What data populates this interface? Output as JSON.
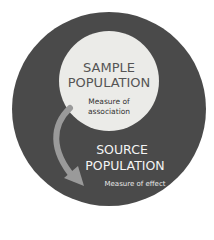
{
  "diagram": {
    "inner_circle": {
      "title_line1": "SAMPLE",
      "title_line2": "POPULATION",
      "sub_line1": "Measure of",
      "sub_line2": "association"
    },
    "outer_circle": {
      "title_line1": "SOURCE",
      "title_line2": "POPULATION",
      "sub": "Measure of effect"
    },
    "colors": {
      "outer": "#4a4a4a",
      "inner": "#ebebe8",
      "arrow": "#9a9a9a"
    }
  }
}
